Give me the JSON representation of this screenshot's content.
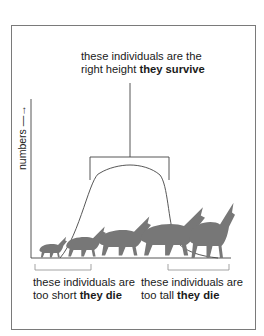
{
  "diagram": {
    "labels": {
      "top_line1": "these individuals are the",
      "top_line2_plain": "right height ",
      "top_line2_bold": "they survive",
      "short_line1": "these individuals are",
      "short_line2_plain": "too short ",
      "short_line2_bold": "they die",
      "tall_line1": "these individuals are",
      "tall_line2_plain": "too tall ",
      "tall_line2_bold": "they die",
      "y_axis": "numbers —→"
    },
    "colors": {
      "line": "#444444",
      "animal": "#777777",
      "frame": "#7a7a7a"
    },
    "animals": [
      "smallest",
      "small",
      "medium",
      "large",
      "largest"
    ]
  }
}
